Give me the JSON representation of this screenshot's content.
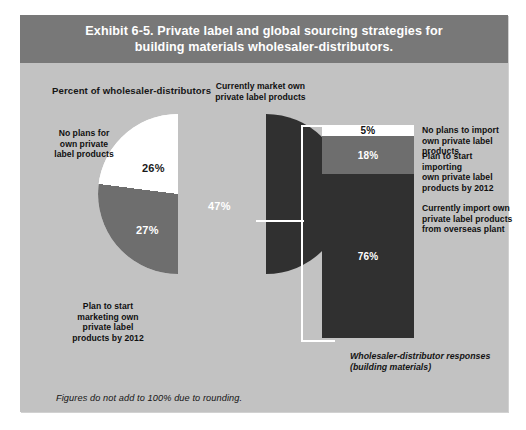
{
  "exhibit": {
    "title_line1": "Exhibit 6-5. Private label and global sourcing strategies for",
    "title_line2": "building materials wholesaler-distributors.",
    "subtitle": "Percent of wholesaler-distributors",
    "footnote": "Figures do not add to 100% due to rounding.",
    "bar_caption_line1": "Wholesaler-distributor responses",
    "bar_caption_line2": "(building materials)"
  },
  "colors": {
    "header_band": "#787878",
    "panel_background": "#c2c2c2",
    "dark_segment": "#303030",
    "mid_segment": "#6e6e6e",
    "light_segment": "#ffffff",
    "connector": "#ffffff"
  },
  "chart_data": [
    {
      "type": "pie",
      "title": "Percent of wholesaler-distributors",
      "categories": [
        "Currently market own private label products",
        "No plans for own private label products",
        "Plan to start marketing own private label products by 2012"
      ],
      "values": [
        47,
        26,
        27
      ],
      "value_labels": [
        "47%",
        "26%",
        "27%"
      ],
      "colors": [
        "#303030",
        "#ffffff",
        "#6e6e6e"
      ],
      "exploded": [
        "Currently market own private label products"
      ],
      "legend": "off",
      "annotations": [
        "Figures do not add to 100% due to rounding."
      ]
    },
    {
      "type": "bar",
      "subtype": "stacked-single-column",
      "title": "Wholesaler-distributor responses (building materials)",
      "categories": [
        "No plans to import own private label products",
        "Plan to start importing own private label products by 2012",
        "Currently import own private label products from overseas plant"
      ],
      "values": [
        5,
        18,
        76
      ],
      "value_labels": [
        "5%",
        "18%",
        "76%"
      ],
      "colors": [
        "#ffffff",
        "#6e6e6e",
        "#303030"
      ],
      "ylim": [
        0,
        100
      ],
      "grid": "off",
      "legend": "right-side-labels",
      "drill_down_from": "47%"
    }
  ],
  "pie": {
    "label_currently_market_l1": "Currently market own",
    "label_currently_market_l2": "private label products",
    "label_no_plans_l1": "No plans for",
    "label_no_plans_l2": "own private",
    "label_no_plans_l3": "label products",
    "label_plan_start_l1": "Plan to start",
    "label_plan_start_l2": "marketing own",
    "label_plan_start_l3": "private label",
    "label_plan_start_l4": "products by 2012",
    "pct_currently_market": "47%",
    "pct_no_plans": "26%",
    "pct_plan_start": "27%"
  },
  "bar": {
    "pct_no_import": "5%",
    "pct_plan_import": "18%",
    "pct_currently_import": "76%",
    "label_no_import_l1": "No plans to import",
    "label_no_import_l2": "own private label products",
    "label_plan_import_l1": "Plan to start importing",
    "label_plan_import_l2": "own private label",
    "label_plan_import_l3": "products by 2012",
    "label_currently_import_l1": "Currently import own",
    "label_currently_import_l2": "private label products",
    "label_currently_import_l3": "from overseas plant"
  }
}
